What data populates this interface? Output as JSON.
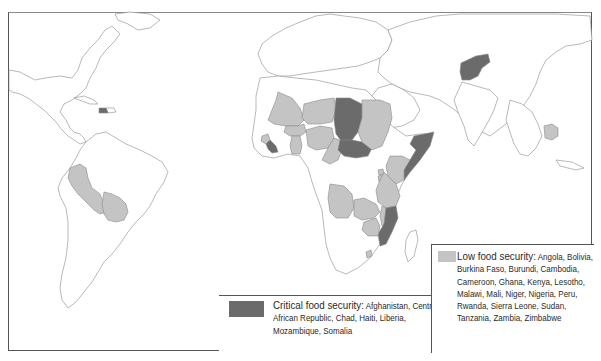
{
  "map": {
    "title": "World map of food security",
    "colors": {
      "critical": "#6b6b6b",
      "low": "#c4c4c4",
      "land": "#ffffff",
      "border": "#8a8a8a",
      "frame": "#555555"
    }
  },
  "legend": {
    "critical": {
      "heading": "Critical food security:",
      "countries_text": "Afghanistan, Central African Republic, Chad, Haiti, Liberia, Mozambique, Somalia",
      "countries": [
        "Afghanistan",
        "Central African Republic",
        "Chad",
        "Haiti",
        "Liberia",
        "Mozambique",
        "Somalia"
      ],
      "color": "#6b6b6b"
    },
    "low": {
      "heading": "Low food security:",
      "countries_text": "Angola, Bolivia, Burkina Faso, Burundi, Cambodia, Cameroon, Ghana, Kenya, Lesotho, Malawi, Mali, Niger, Nigeria, Peru, Rwanda, Sierra Leone, Sudan, Tanzania, Zambia, Zimbabwe",
      "countries": [
        "Angola",
        "Bolivia",
        "Burkina Faso",
        "Burundi",
        "Cambodia",
        "Cameroon",
        "Ghana",
        "Kenya",
        "Lesotho",
        "Malawi",
        "Mali",
        "Niger",
        "Nigeria",
        "Peru",
        "Rwanda",
        "Sierra Leone",
        "Sudan",
        "Tanzania",
        "Zambia",
        "Zimbabwe"
      ],
      "color": "#c4c4c4"
    }
  }
}
